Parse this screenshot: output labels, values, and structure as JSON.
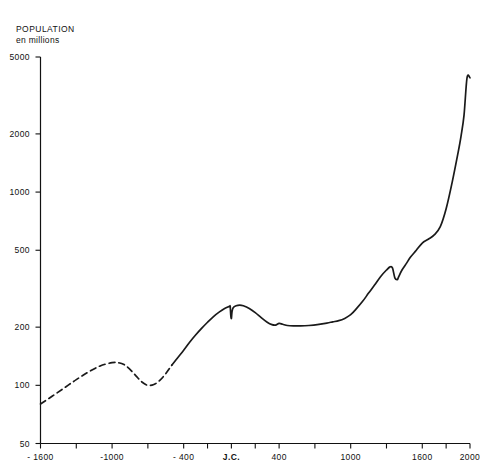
{
  "chart_data": {
    "type": "line",
    "title": "POPULATION",
    "subtitle": "en millions",
    "xlabel": "",
    "ylabel": "",
    "yscale": "log",
    "ylim": [
      50,
      5000
    ],
    "xlim": [
      -1600,
      2000
    ],
    "grid": false,
    "legend": null,
    "y_ticks": [
      {
        "value": 5000,
        "label": "5000"
      },
      {
        "value": 2000,
        "label": "2000"
      },
      {
        "value": 1000,
        "label": "1000"
      },
      {
        "value": 500,
        "label": "500"
      },
      {
        "value": 200,
        "label": "200"
      },
      {
        "value": 100,
        "label": "100"
      },
      {
        "value": 50,
        "label": "50"
      }
    ],
    "x_ticks": [
      {
        "value": -1600,
        "label": "- 1600"
      },
      {
        "value": -1300,
        "label": ""
      },
      {
        "value": -1000,
        "label": "-1000"
      },
      {
        "value": -700,
        "label": ""
      },
      {
        "value": -400,
        "label": "- 400"
      },
      {
        "value": -200,
        "label": ""
      },
      {
        "value": 0,
        "label": "J.C."
      },
      {
        "value": 200,
        "label": ""
      },
      {
        "value": 400,
        "label": "400"
      },
      {
        "value": 700,
        "label": ""
      },
      {
        "value": 1000,
        "label": "1000"
      },
      {
        "value": 1300,
        "label": ""
      },
      {
        "value": 1600,
        "label": "1600"
      },
      {
        "value": 1800,
        "label": ""
      },
      {
        "value": 2000,
        "label": "2000"
      }
    ],
    "series": [
      {
        "name": "Population mondiale (estimation)",
        "style": "dashed",
        "color": "#1a1a1a",
        "points": [
          [
            -1600,
            80
          ],
          [
            -1500,
            88
          ],
          [
            -1400,
            97
          ],
          [
            -1300,
            107
          ],
          [
            -1200,
            117
          ],
          [
            -1100,
            126
          ],
          [
            -1000,
            131
          ],
          [
            -950,
            131
          ],
          [
            -900,
            128
          ],
          [
            -850,
            121
          ],
          [
            -800,
            112
          ],
          [
            -750,
            104
          ],
          [
            -700,
            100
          ],
          [
            -650,
            101
          ],
          [
            -600,
            106
          ],
          [
            -550,
            115
          ],
          [
            -500,
            127
          ]
        ]
      },
      {
        "name": "Population mondiale (observée)",
        "style": "solid",
        "color": "#1a1a1a",
        "points": [
          [
            -500,
            127
          ],
          [
            -450,
            139
          ],
          [
            -400,
            152
          ],
          [
            -350,
            167
          ],
          [
            -300,
            182
          ],
          [
            -250,
            197
          ],
          [
            -200,
            212
          ],
          [
            -150,
            227
          ],
          [
            -100,
            240
          ],
          [
            -60,
            249
          ],
          [
            -30,
            254
          ],
          [
            -15,
            256
          ],
          [
            -10,
            256
          ],
          [
            -5,
            230
          ],
          [
            0,
            222
          ],
          [
            5,
            240
          ],
          [
            15,
            252
          ],
          [
            40,
            258
          ],
          [
            70,
            260
          ],
          [
            100,
            258
          ],
          [
            150,
            250
          ],
          [
            200,
            238
          ],
          [
            250,
            224
          ],
          [
            300,
            212
          ],
          [
            340,
            206
          ],
          [
            370,
            205
          ],
          [
            400,
            209
          ],
          [
            430,
            207
          ],
          [
            470,
            204
          ],
          [
            520,
            203
          ],
          [
            580,
            203
          ],
          [
            650,
            204
          ],
          [
            720,
            206
          ],
          [
            800,
            210
          ],
          [
            850,
            213
          ],
          [
            900,
            216
          ],
          [
            950,
            222
          ],
          [
            1000,
            232
          ],
          [
            1050,
            250
          ],
          [
            1100,
            272
          ],
          [
            1150,
            300
          ],
          [
            1200,
            330
          ],
          [
            1250,
            365
          ],
          [
            1300,
            395
          ],
          [
            1330,
            410
          ],
          [
            1350,
            405
          ],
          [
            1370,
            360
          ],
          [
            1390,
            352
          ],
          [
            1400,
            362
          ],
          [
            1430,
            395
          ],
          [
            1470,
            430
          ],
          [
            1500,
            460
          ],
          [
            1550,
            500
          ],
          [
            1600,
            545
          ],
          [
            1650,
            570
          ],
          [
            1700,
            600
          ],
          [
            1750,
            660
          ],
          [
            1800,
            820
          ],
          [
            1850,
            1120
          ],
          [
            1900,
            1600
          ],
          [
            1925,
            1950
          ],
          [
            1950,
            2500
          ],
          [
            1975,
            3900
          ],
          [
            2000,
            3900
          ]
        ]
      }
    ]
  },
  "axes": {
    "y_title_line1": "POPULATION",
    "y_title_line2": "en millions"
  }
}
